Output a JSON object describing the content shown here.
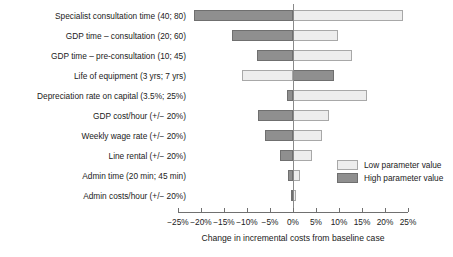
{
  "chart_data": {
    "type": "bar",
    "subtype": "tornado-diverging",
    "title": "",
    "xlabel": "Change in incremental costs from baseline case",
    "ylabel": "",
    "xlim": [
      -27.5,
      27.5
    ],
    "xticks": [
      -25,
      -20,
      -15,
      -10,
      -5,
      0,
      5,
      10,
      15,
      20,
      25
    ],
    "xticklabels": [
      "−25%",
      "−20%",
      "−15%",
      "−10%",
      "−5%",
      "0%",
      "5%",
      "10%",
      "15%",
      "20%",
      "25%"
    ],
    "grid": false,
    "legend_position": "right-inside-lower",
    "legend": [
      {
        "name": "Low parameter value",
        "color": "#ededed"
      },
      {
        "name": "High parameter value",
        "color": "#8f8f8f"
      }
    ],
    "categories": [
      "Specialist consultation time (40; 80)",
      "GDP time – consultation (20; 60)",
      "GDP time – pre-consultation (10; 45)",
      "Life of equipment (3 yrs; 7 yrs)",
      "Depreciation rate on capital (3.5%; 25%)",
      "GDP cost/hour (+/− 20%)",
      "Weekly wage rate (+/− 20%)",
      "Line rental (+/− 20%)",
      "Admin time (20 min; 45 min)",
      "Admin costs/hour (+/− 20%)"
    ],
    "bars": [
      {
        "category": "Specialist consultation time (40; 80)",
        "low": 24.0,
        "high": -21.5
      },
      {
        "category": "GDP time – consultation (20; 60)",
        "low": 9.8,
        "high": -13.3
      },
      {
        "category": "GDP time – pre-consultation (10; 45)",
        "low": 12.8,
        "high": -7.8
      },
      {
        "category": "Life of equipment (3 yrs; 7 yrs)",
        "low": -11.0,
        "high": 8.9
      },
      {
        "category": "Depreciation rate on capital (3.5%; 25%)",
        "low": 16.0,
        "high": -1.2
      },
      {
        "category": "GDP cost/hour (+/− 20%)",
        "low": 7.8,
        "high": -7.6
      },
      {
        "category": "Weekly wage rate (+/− 20%)",
        "low": 6.3,
        "high": -6.1
      },
      {
        "category": "Line rental (+/− 20%)",
        "low": 4.1,
        "high": -2.8
      },
      {
        "category": "Admin time (20 min; 45 min)",
        "low": 1.5,
        "high": -1.1
      },
      {
        "category": "Admin costs/hour (+/− 20%)",
        "low": 0.6,
        "high": -0.4
      }
    ]
  }
}
